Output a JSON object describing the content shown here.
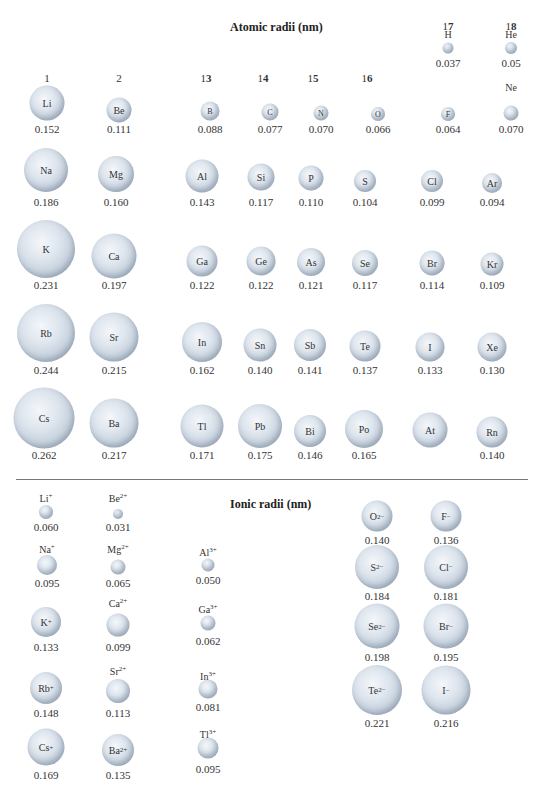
{
  "chart_data": {
    "type": "scatter",
    "title": "Atomic radii (nm)",
    "subtitle": "Ionic radii (nm)",
    "atomic": {
      "groups": [
        "1",
        "2",
        "13",
        "14",
        "15",
        "16",
        "17",
        "18"
      ],
      "elements": [
        {
          "symbol": "H",
          "group": "17",
          "period": 1,
          "radius": 0.037
        },
        {
          "symbol": "He",
          "group": "18",
          "period": 1,
          "radius": 0.05
        },
        {
          "symbol": "Li",
          "group": "1",
          "period": 2,
          "radius": 0.152
        },
        {
          "symbol": "Be",
          "group": "2",
          "period": 2,
          "radius": 0.111
        },
        {
          "symbol": "B",
          "group": "13",
          "period": 2,
          "radius": 0.088
        },
        {
          "symbol": "C",
          "group": "14",
          "period": 2,
          "radius": 0.077
        },
        {
          "symbol": "N",
          "group": "15",
          "period": 2,
          "radius": 0.07
        },
        {
          "symbol": "O",
          "group": "16",
          "period": 2,
          "radius": 0.066
        },
        {
          "symbol": "F",
          "group": "17",
          "period": 2,
          "radius": 0.064
        },
        {
          "symbol": "Ne",
          "group": "18",
          "period": 2,
          "radius": 0.07
        },
        {
          "symbol": "Na",
          "group": "1",
          "period": 3,
          "radius": 0.186
        },
        {
          "symbol": "Mg",
          "group": "2",
          "period": 3,
          "radius": 0.16
        },
        {
          "symbol": "Al",
          "group": "13",
          "period": 3,
          "radius": 0.143
        },
        {
          "symbol": "Si",
          "group": "14",
          "period": 3,
          "radius": 0.117
        },
        {
          "symbol": "P",
          "group": "15",
          "period": 3,
          "radius": 0.11
        },
        {
          "symbol": "S",
          "group": "16",
          "period": 3,
          "radius": 0.104
        },
        {
          "symbol": "Cl",
          "group": "17",
          "period": 3,
          "radius": 0.099
        },
        {
          "symbol": "Ar",
          "group": "18",
          "period": 3,
          "radius": 0.094
        },
        {
          "symbol": "K",
          "group": "1",
          "period": 4,
          "radius": 0.231
        },
        {
          "symbol": "Ca",
          "group": "2",
          "period": 4,
          "radius": 0.197
        },
        {
          "symbol": "Ga",
          "group": "13",
          "period": 4,
          "radius": 0.122
        },
        {
          "symbol": "Ge",
          "group": "14",
          "period": 4,
          "radius": 0.122
        },
        {
          "symbol": "As",
          "group": "15",
          "period": 4,
          "radius": 0.121
        },
        {
          "symbol": "Se",
          "group": "16",
          "period": 4,
          "radius": 0.117
        },
        {
          "symbol": "Br",
          "group": "17",
          "period": 4,
          "radius": 0.114
        },
        {
          "symbol": "Kr",
          "group": "18",
          "period": 4,
          "radius": 0.109
        },
        {
          "symbol": "Rb",
          "group": "1",
          "period": 5,
          "radius": 0.244
        },
        {
          "symbol": "Sr",
          "group": "2",
          "period": 5,
          "radius": 0.215
        },
        {
          "symbol": "In",
          "group": "13",
          "period": 5,
          "radius": 0.162
        },
        {
          "symbol": "Sn",
          "group": "14",
          "period": 5,
          "radius": 0.14
        },
        {
          "symbol": "Sb",
          "group": "15",
          "period": 5,
          "radius": 0.141
        },
        {
          "symbol": "Te",
          "group": "16",
          "period": 5,
          "radius": 0.137
        },
        {
          "symbol": "I",
          "group": "17",
          "period": 5,
          "radius": 0.133
        },
        {
          "symbol": "Xe",
          "group": "18",
          "period": 5,
          "radius": 0.13
        },
        {
          "symbol": "Cs",
          "group": "1",
          "period": 6,
          "radius": 0.262
        },
        {
          "symbol": "Ba",
          "group": "2",
          "period": 6,
          "radius": 0.217
        },
        {
          "symbol": "Tl",
          "group": "13",
          "period": 6,
          "radius": 0.171
        },
        {
          "symbol": "Pb",
          "group": "14",
          "period": 6,
          "radius": 0.175
        },
        {
          "symbol": "Bi",
          "group": "15",
          "period": 6,
          "radius": 0.146
        },
        {
          "symbol": "Po",
          "group": "16",
          "period": 6,
          "radius": 0.165
        },
        {
          "symbol": "At",
          "group": "17",
          "period": 6,
          "radius": null
        },
        {
          "symbol": "Rn",
          "group": "18",
          "period": 6,
          "radius": 0.14
        }
      ]
    },
    "ionic": [
      {
        "ion": "Li+",
        "radius": 0.06
      },
      {
        "ion": "Be2+",
        "radius": 0.031
      },
      {
        "ion": "Na+",
        "radius": 0.095
      },
      {
        "ion": "Mg2+",
        "radius": 0.065
      },
      {
        "ion": "Al3+",
        "radius": 0.05
      },
      {
        "ion": "K+",
        "radius": 0.133
      },
      {
        "ion": "Ca2+",
        "radius": 0.099
      },
      {
        "ion": "Ga3+",
        "radius": 0.062
      },
      {
        "ion": "Rb+",
        "radius": 0.148
      },
      {
        "ion": "Sr2+",
        "radius": 0.113
      },
      {
        "ion": "In3+",
        "radius": 0.081
      },
      {
        "ion": "Cs+",
        "radius": 0.169
      },
      {
        "ion": "Ba2+",
        "radius": 0.135
      },
      {
        "ion": "Tl3+",
        "radius": 0.095
      },
      {
        "ion": "O2-",
        "radius": 0.14
      },
      {
        "ion": "F-",
        "radius": 0.136
      },
      {
        "ion": "S2-",
        "radius": 0.184
      },
      {
        "ion": "Cl-",
        "radius": 0.181
      },
      {
        "ion": "Se2-",
        "radius": 0.198
      },
      {
        "ion": "Br-",
        "radius": 0.195
      },
      {
        "ion": "Te2-",
        "radius": 0.221
      },
      {
        "ion": "I-",
        "radius": 0.216
      }
    ],
    "xlabel": "",
    "ylabel": "",
    "grid": false
  },
  "titles": {
    "atomic": "Atomic radii (nm)",
    "ionic": "Ionic radii (nm)"
  },
  "groups": {
    "g1": "1",
    "g2": "2",
    "g13a": "1",
    "g13b": "3",
    "g14a": "1",
    "g14b": "4",
    "g15a": "1",
    "g15b": "5",
    "g16a": "1",
    "g16b": "6",
    "g17a": "1",
    "g17b": "7",
    "g18a": "1",
    "g18b": "8"
  },
  "atoms": [
    {
      "s": "H",
      "v": "0.037",
      "x": 448,
      "y": 48,
      "d": 11,
      "inside": false,
      "ly": 29,
      "vy": 57
    },
    {
      "s": "He",
      "v": "0.05",
      "x": 511,
      "y": 48,
      "d": 12,
      "inside": false,
      "ly": 29,
      "vy": 57
    },
    {
      "s": "Ne",
      "v": "0.070",
      "x": 511,
      "y": 113,
      "d": 15,
      "inside": false,
      "ly": 82,
      "vy": 123
    },
    {
      "s": "Li",
      "v": "0.152",
      "x": 47,
      "y": 103,
      "d": 35,
      "inside": true,
      "vy": 123
    },
    {
      "s": "Be",
      "v": "0.111",
      "x": 119,
      "y": 110,
      "d": 25,
      "inside": true,
      "vy": 123
    },
    {
      "s": "B",
      "v": "0.088",
      "x": 210,
      "y": 111,
      "d": 19,
      "inside": true,
      "vy": 123
    },
    {
      "s": "C",
      "v": "0.077",
      "x": 270,
      "y": 112,
      "d": 17,
      "inside": true,
      "vy": 123
    },
    {
      "s": "N",
      "v": "0.070",
      "x": 321,
      "y": 113,
      "d": 15,
      "inside": true,
      "vy": 123
    },
    {
      "s": "O",
      "v": "0.066",
      "x": 378,
      "y": 114,
      "d": 14,
      "inside": true,
      "vy": 123
    },
    {
      "s": "F",
      "v": "0.064",
      "x": 448,
      "y": 114,
      "d": 14,
      "inside": true,
      "vy": 123
    },
    {
      "s": "Na",
      "v": "0.186",
      "x": 46,
      "y": 170,
      "d": 44,
      "inside": true,
      "vy": 196
    },
    {
      "s": "Mg",
      "v": "0.160",
      "x": 116,
      "y": 174,
      "d": 36,
      "inside": true,
      "vy": 196
    },
    {
      "s": "Al",
      "v": "0.143",
      "x": 202,
      "y": 176,
      "d": 33,
      "inside": true,
      "vy": 196
    },
    {
      "s": "Si",
      "v": "0.117",
      "x": 261,
      "y": 177,
      "d": 27,
      "inside": true,
      "vy": 196
    },
    {
      "s": "P",
      "v": "0.110",
      "x": 311,
      "y": 178,
      "d": 25,
      "inside": true,
      "vy": 196
    },
    {
      "s": "S",
      "v": "0.104",
      "x": 365,
      "y": 181,
      "d": 22,
      "inside": true,
      "vy": 196
    },
    {
      "s": "Cl",
      "v": "0.099",
      "x": 432,
      "y": 181,
      "d": 22,
      "inside": true,
      "vy": 196
    },
    {
      "s": "Ar",
      "v": "0.094",
      "x": 492,
      "y": 183,
      "d": 20,
      "inside": true,
      "vy": 196
    },
    {
      "s": "K",
      "v": "0.231",
      "x": 46,
      "y": 249,
      "d": 58,
      "inside": true,
      "vy": 279
    },
    {
      "s": "Ca",
      "v": "0.197",
      "x": 114,
      "y": 256,
      "d": 45,
      "inside": true,
      "vy": 279
    },
    {
      "s": "Ga",
      "v": "0.122",
      "x": 202,
      "y": 261,
      "d": 31,
      "inside": true,
      "vy": 279
    },
    {
      "s": "Ge",
      "v": "0.122",
      "x": 261,
      "y": 261,
      "d": 29,
      "inside": true,
      "vy": 279
    },
    {
      "s": "As",
      "v": "0.121",
      "x": 311,
      "y": 262,
      "d": 28,
      "inside": true,
      "vy": 279
    },
    {
      "s": "Se",
      "v": "0.117",
      "x": 365,
      "y": 263,
      "d": 26,
      "inside": true,
      "vy": 279
    },
    {
      "s": "Br",
      "v": "0.114",
      "x": 432,
      "y": 263,
      "d": 25,
      "inside": true,
      "vy": 279
    },
    {
      "s": "Kr",
      "v": "0.109",
      "x": 492,
      "y": 264,
      "d": 23,
      "inside": true,
      "vy": 279
    },
    {
      "s": "Rb",
      "v": "0.244",
      "x": 46,
      "y": 333,
      "d": 58,
      "inside": true,
      "vy": 364
    },
    {
      "s": "Sr",
      "v": "0.215",
      "x": 114,
      "y": 337,
      "d": 49,
      "inside": true,
      "vy": 364
    },
    {
      "s": "In",
      "v": "0.162",
      "x": 202,
      "y": 342,
      "d": 40,
      "inside": true,
      "vy": 364
    },
    {
      "s": "Sn",
      "v": "0.140",
      "x": 260,
      "y": 345,
      "d": 33,
      "inside": true,
      "vy": 364
    },
    {
      "s": "Sb",
      "v": "0.141",
      "x": 310,
      "y": 345,
      "d": 32,
      "inside": true,
      "vy": 364
    },
    {
      "s": "Te",
      "v": "0.137",
      "x": 365,
      "y": 346,
      "d": 31,
      "inside": true,
      "vy": 364
    },
    {
      "s": "I",
      "v": "0.133",
      "x": 430,
      "y": 347,
      "d": 29,
      "inside": true,
      "vy": 364
    },
    {
      "s": "Xe",
      "v": "0.130",
      "x": 492,
      "y": 347,
      "d": 29,
      "inside": true,
      "vy": 364
    },
    {
      "s": "Cs",
      "v": "0.262",
      "x": 44,
      "y": 418,
      "d": 61,
      "inside": true,
      "vy": 449
    },
    {
      "s": "Ba",
      "v": "0.217",
      "x": 114,
      "y": 423,
      "d": 49,
      "inside": true,
      "vy": 449
    },
    {
      "s": "Tl",
      "v": "0.171",
      "x": 202,
      "y": 426,
      "d": 43,
      "inside": true,
      "vy": 449
    },
    {
      "s": "Pb",
      "v": "0.175",
      "x": 260,
      "y": 426,
      "d": 44,
      "inside": true,
      "vy": 449
    },
    {
      "s": "Bi",
      "v": "0.146",
      "x": 310,
      "y": 431,
      "d": 32,
      "inside": true,
      "vy": 449
    },
    {
      "s": "Po",
      "v": "0.165",
      "x": 364,
      "y": 429,
      "d": 38,
      "inside": true,
      "vy": 449
    },
    {
      "s": "At",
      "v": "",
      "x": 430,
      "y": 430,
      "d": 35,
      "inside": true,
      "vy": 449
    },
    {
      "s": "Rn",
      "v": "0.140",
      "x": 492,
      "y": 432,
      "d": 31,
      "inside": true,
      "vy": 449
    }
  ],
  "ions": [
    {
      "base": "Li",
      "ch": "+",
      "v": "0.060",
      "x": 46,
      "y": 512,
      "d": 14,
      "inside": false,
      "ly": 492,
      "vy": 521
    },
    {
      "base": "Be",
      "ch": "2+",
      "v": "0.031",
      "x": 118,
      "y": 514,
      "d": 10,
      "inside": false,
      "ly": 492,
      "vy": 521
    },
    {
      "base": "Na",
      "ch": "+",
      "v": "0.095",
      "x": 47,
      "y": 565,
      "d": 20,
      "inside": false,
      "ly": 543,
      "vy": 577
    },
    {
      "base": "Mg",
      "ch": "2+",
      "v": "0.065",
      "x": 118,
      "y": 567,
      "d": 15,
      "inside": false,
      "ly": 543,
      "vy": 577
    },
    {
      "base": "Al",
      "ch": "3+",
      "v": "0.050",
      "x": 208,
      "y": 565,
      "d": 13,
      "inside": false,
      "ly": 546,
      "vy": 574
    },
    {
      "base": "K",
      "ch": "+",
      "v": "0.133",
      "x": 46,
      "y": 622,
      "d": 30,
      "inside": true,
      "vy": 641
    },
    {
      "base": "Ca",
      "ch": "2+",
      "v": "0.099",
      "x": 118,
      "y": 625,
      "d": 23,
      "inside": false,
      "ly": 597,
      "vy": 641
    },
    {
      "base": "Ga",
      "ch": "3+",
      "v": "0.062",
      "x": 208,
      "y": 623,
      "d": 15,
      "inside": false,
      "ly": 603,
      "vy": 635
    },
    {
      "base": "Rb",
      "ch": "+",
      "v": "0.148",
      "x": 46,
      "y": 688,
      "d": 32,
      "inside": true,
      "vy": 707
    },
    {
      "base": "Sr",
      "ch": "2+",
      "v": "0.113",
      "x": 118,
      "y": 691,
      "d": 24,
      "inside": false,
      "ly": 665,
      "vy": 707
    },
    {
      "base": "In",
      "ch": "3+",
      "v": "0.081",
      "x": 208,
      "y": 689,
      "d": 19,
      "inside": false,
      "ly": 670,
      "vy": 701
    },
    {
      "base": "Cs",
      "ch": "+",
      "v": "0.169",
      "x": 46,
      "y": 747,
      "d": 37,
      "inside": true,
      "vy": 769
    },
    {
      "base": "Ba",
      "ch": "2+",
      "v": "0.135",
      "x": 118,
      "y": 750,
      "d": 32,
      "inside": true,
      "vy": 769
    },
    {
      "base": "Tl",
      "ch": "3+",
      "v": "0.095",
      "x": 208,
      "y": 748,
      "d": 21,
      "inside": false,
      "ly": 728,
      "vy": 763
    },
    {
      "base": "O",
      "ch": "2−",
      "v": "0.140",
      "x": 377,
      "y": 516,
      "d": 31,
      "inside": true,
      "vy": 534
    },
    {
      "base": "F",
      "ch": "−",
      "v": "0.136",
      "x": 446,
      "y": 516,
      "d": 31,
      "inside": true,
      "vy": 534
    },
    {
      "base": "S",
      "ch": "2−",
      "v": "0.184",
      "x": 377,
      "y": 567,
      "d": 44,
      "inside": true,
      "vy": 590
    },
    {
      "base": "Cl",
      "ch": "−",
      "v": "0.181",
      "x": 446,
      "y": 567,
      "d": 44,
      "inside": true,
      "vy": 590
    },
    {
      "base": "Se",
      "ch": "2−",
      "v": "0.198",
      "x": 377,
      "y": 626,
      "d": 45,
      "inside": true,
      "vy": 651
    },
    {
      "base": "Br",
      "ch": "−",
      "v": "0.195",
      "x": 446,
      "y": 626,
      "d": 45,
      "inside": true,
      "vy": 651
    },
    {
      "base": "Te",
      "ch": "2−",
      "v": "0.221",
      "x": 377,
      "y": 690,
      "d": 50,
      "inside": true,
      "vy": 717
    },
    {
      "base": "I",
      "ch": "−",
      "v": "0.216",
      "x": 446,
      "y": 690,
      "d": 49,
      "inside": true,
      "vy": 717
    }
  ]
}
